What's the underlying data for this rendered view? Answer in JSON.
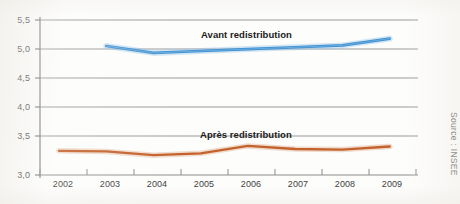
{
  "chart_data": {
    "type": "line",
    "title": "",
    "subtitle": "",
    "xlabel": "",
    "ylabel": "",
    "source": "Source : INSEE",
    "grid": true,
    "legend_position": "inline-annotation",
    "x": [
      2002,
      2003,
      2004,
      2005,
      2006,
      2007,
      2008,
      2009
    ],
    "xtick_labels": [
      "2002",
      "2003",
      "2004",
      "2005",
      "2006",
      "2007",
      "2008",
      "2009"
    ],
    "xlim": [
      2001.6,
      2009.6
    ],
    "ylim": [
      3.0,
      5.5
    ],
    "ytick_values": [
      3.0,
      3.5,
      4.0,
      4.5,
      5.0,
      5.5
    ],
    "ytick_labels": [
      "3,0",
      "3,5",
      "4,0",
      "4,5",
      "5,0",
      "5,5"
    ],
    "series": [
      {
        "name": "Avant redistribution",
        "color": "#3d8fd1",
        "label_x": 2005.35,
        "label_y": 5.28,
        "x": [
          2003,
          2004,
          2005,
          2006,
          2007,
          2008,
          2009
        ],
        "values": [
          5.08,
          4.97,
          5.0,
          5.03,
          5.06,
          5.09,
          5.2
        ]
      },
      {
        "name": "Après redistribution",
        "color": "#c4622d",
        "label_x": 2005.35,
        "label_y": 3.72,
        "x": [
          2002,
          2003,
          2004,
          2005,
          2006,
          2007,
          2008,
          2009
        ],
        "values": [
          3.39,
          3.38,
          3.32,
          3.35,
          3.47,
          3.42,
          3.41,
          3.46
        ]
      }
    ]
  },
  "axis": {
    "ytick_labels": [
      "5,5",
      "5,0",
      "4,5",
      "4,0",
      "3,5",
      "3,0"
    ],
    "xtick_labels": [
      "2002",
      "2003",
      "2004",
      "2005",
      "2006",
      "2007",
      "2008",
      "2009"
    ]
  },
  "annotations": {
    "series_avant": "Avant redistribution",
    "series_apres": "Après redistribution",
    "source": "Source : INSEE"
  },
  "colors": {
    "line_avant": "#3d8fd1",
    "line_apres": "#c4622d",
    "grid": "#9a9a9a",
    "axis": "#6e6e6e",
    "background": "#fdfdfc"
  }
}
